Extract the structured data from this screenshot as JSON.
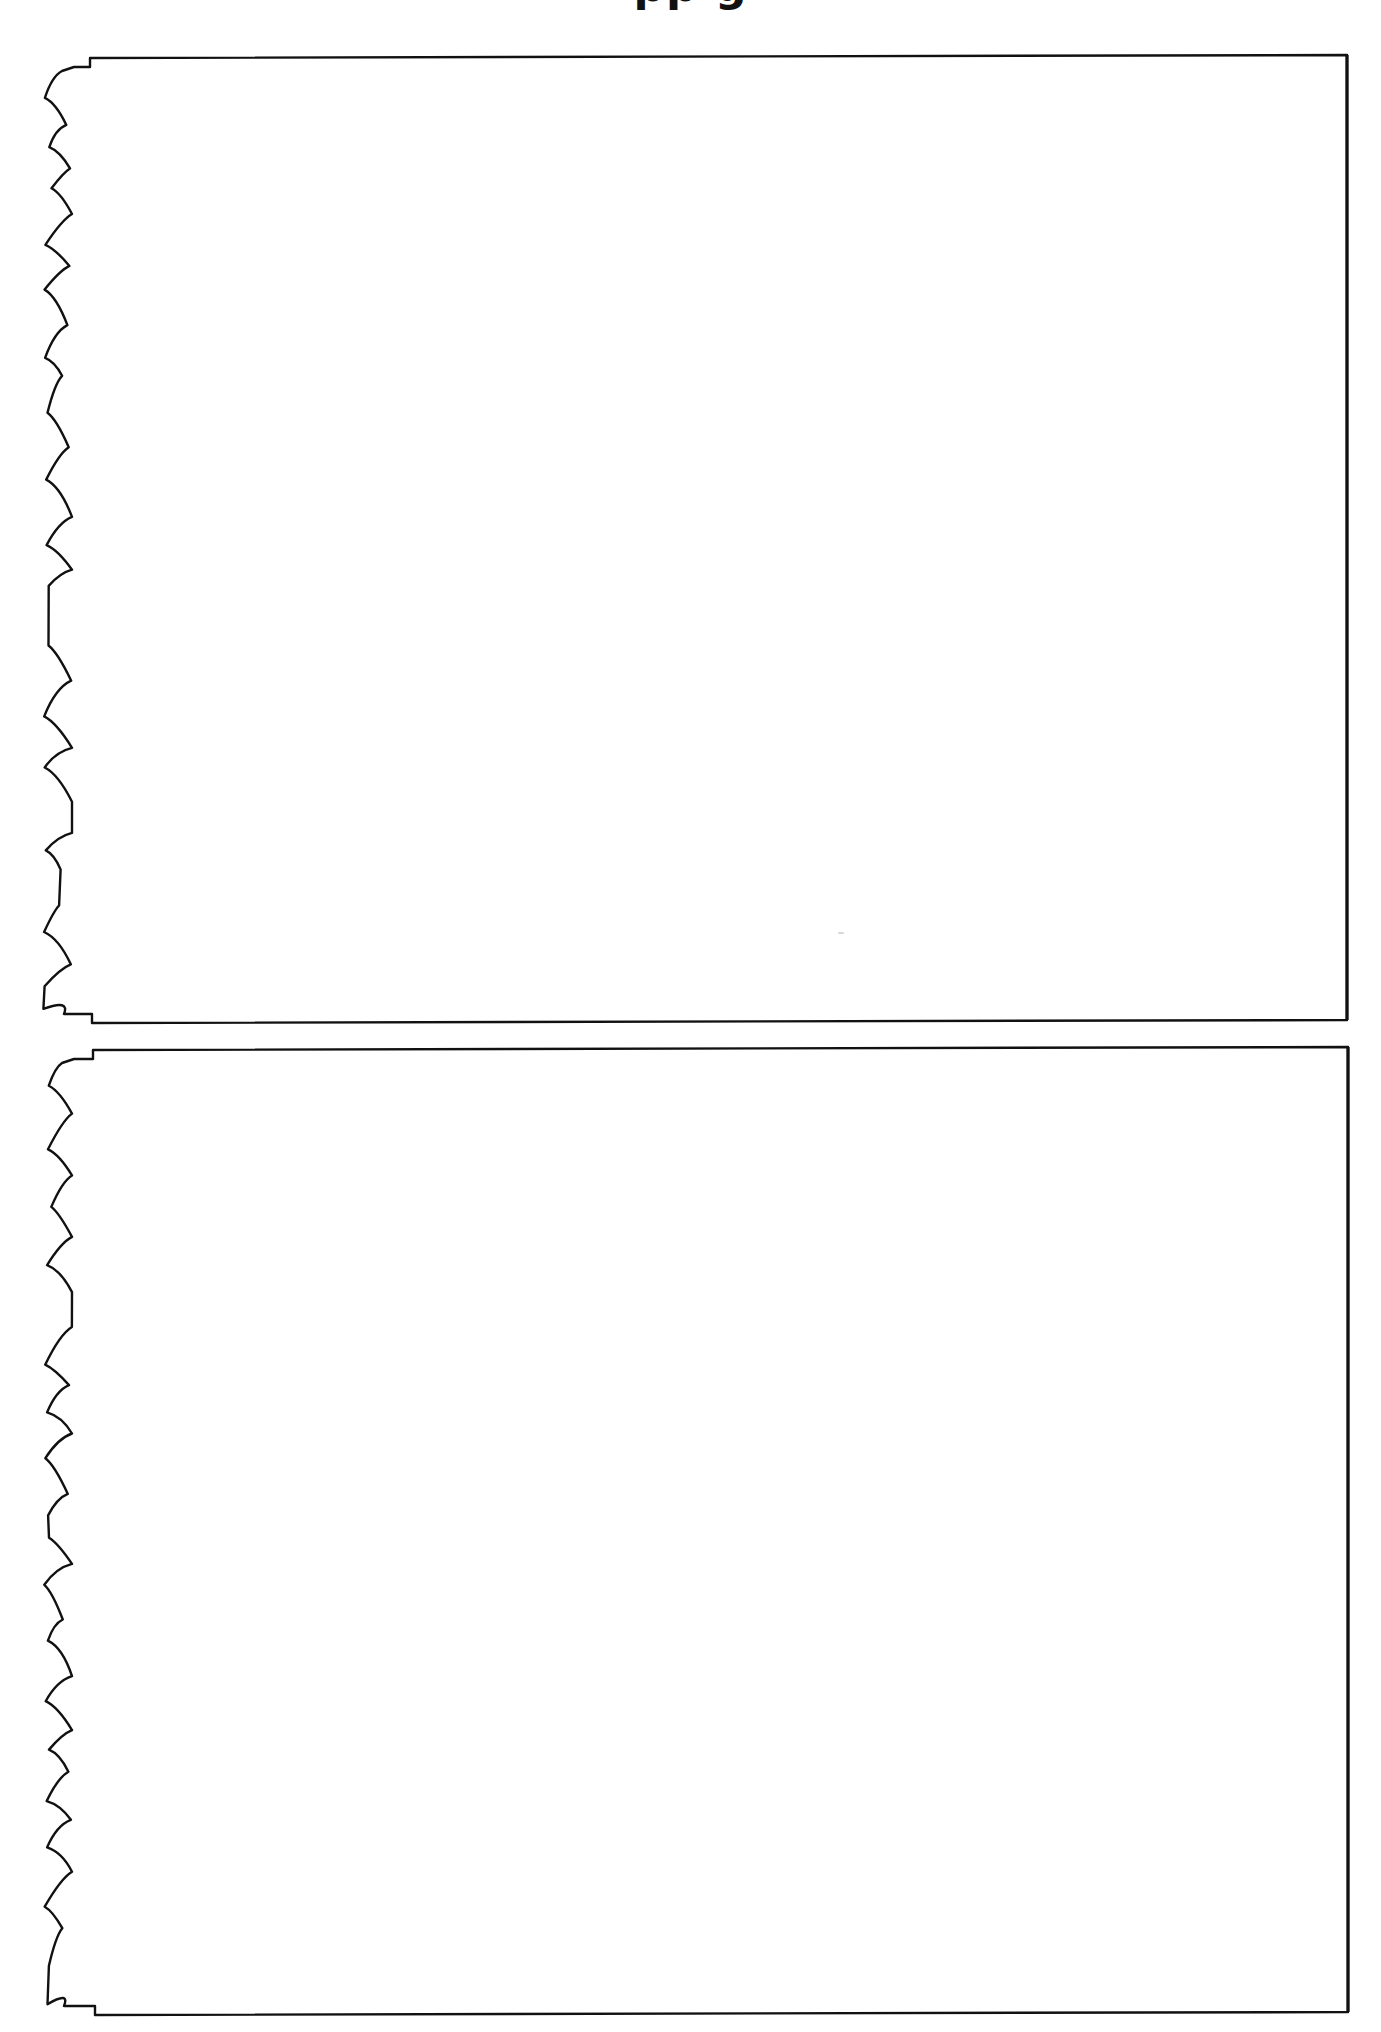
{
  "page": {
    "title_visible_fragment": "pp g",
    "background": "#ffffff",
    "stroke_color": "#111111"
  },
  "sheets": [
    {
      "id": "sheet-1",
      "top": 55,
      "bottom": 1020,
      "left_step_x": 90,
      "right": 1347,
      "content": ""
    },
    {
      "id": "sheet-2",
      "top": 1047,
      "bottom": 2012,
      "left_step_x": 93,
      "right": 1348,
      "content": ""
    }
  ]
}
